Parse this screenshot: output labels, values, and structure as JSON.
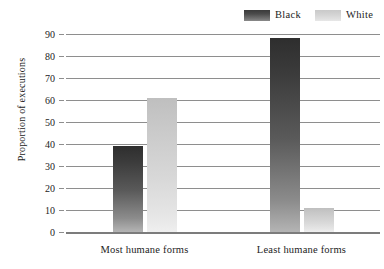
{
  "chart_data": {
    "type": "bar",
    "title": "",
    "xlabel": "",
    "ylabel": "Proportion of executions",
    "categories": [
      "Most humane forms",
      "Least humane forms"
    ],
    "series": [
      {
        "name": "Black",
        "values": [
          39,
          88
        ],
        "color": "#3b3b3b"
      },
      {
        "name": "White",
        "values": [
          61,
          11
        ],
        "color": "#d8d8d8"
      }
    ],
    "ylim": [
      0,
      90
    ],
    "ytick_step": 10,
    "yticks": [
      90,
      80,
      70,
      60,
      50,
      40,
      30,
      20,
      10,
      0
    ],
    "ytick_labels": [
      "90",
      "80",
      "70",
      "60",
      "50",
      "40",
      "30",
      "20",
      "10",
      "0"
    ],
    "grid": true,
    "grid_axis": "y",
    "legend_position": "top-right"
  },
  "legend": {
    "entries": [
      {
        "label": "Black",
        "swatch": "black-gradient-swatch"
      },
      {
        "label": "White",
        "swatch": "white-gradient-swatch"
      }
    ]
  },
  "axes": {
    "y_title": "Proportion of executions"
  },
  "colors": {
    "grid": "#8e8e8e",
    "axis": "#7c7c7c",
    "text": "#232323",
    "background": "#ffffff"
  }
}
